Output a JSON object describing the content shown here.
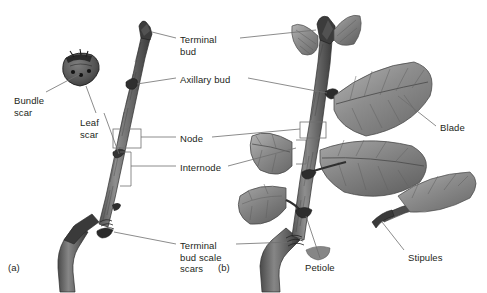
{
  "figure": {
    "background": "#ffffff",
    "ink": "#231f20",
    "leader_color": "#6f6f6f",
    "type": "botanical-illustration"
  },
  "panels": [
    {
      "id": "a",
      "label": "(a)",
      "x": 8,
      "y": 262,
      "description": "dormant winter twig"
    },
    {
      "id": "b",
      "label": "(b)",
      "x": 218,
      "y": 262,
      "description": "growing leafy shoot"
    }
  ],
  "labels": [
    {
      "name": "terminal-bud",
      "lines": [
        "Terminal",
        "bud"
      ],
      "x": 180,
      "y": 34
    },
    {
      "name": "axillary-bud",
      "lines": [
        "Axillary bud"
      ],
      "x": 180,
      "y": 74
    },
    {
      "name": "node",
      "lines": [
        "Node"
      ],
      "x": 180,
      "y": 133
    },
    {
      "name": "internode",
      "lines": [
        "Internode"
      ],
      "x": 180,
      "y": 162
    },
    {
      "name": "terminal-bud-scale-scars",
      "lines": [
        "Terminal",
        "bud scale",
        "scars"
      ],
      "x": 180,
      "y": 240
    },
    {
      "name": "bundle-scar",
      "lines": [
        "Bundle",
        "scar"
      ],
      "x": 14,
      "y": 95
    },
    {
      "name": "leaf-scar",
      "lines": [
        "Leaf",
        "scar"
      ],
      "x": 80,
      "y": 117
    },
    {
      "name": "blade",
      "lines": [
        "Blade"
      ],
      "x": 440,
      "y": 122
    },
    {
      "name": "petiole",
      "lines": [
        "Petiole"
      ],
      "x": 305,
      "y": 262
    },
    {
      "name": "stipules",
      "lines": [
        "Stipules"
      ],
      "x": 408,
      "y": 252
    }
  ],
  "structures": {
    "dormant_twig": [
      "terminal bud",
      "axillary bud",
      "leaf scar",
      "bundle scar",
      "node",
      "internode",
      "terminal bud scale scars"
    ],
    "leafy_shoot": [
      "terminal bud",
      "axillary bud",
      "blade",
      "petiole",
      "stipules",
      "node",
      "internode",
      "terminal bud scale scars"
    ]
  }
}
